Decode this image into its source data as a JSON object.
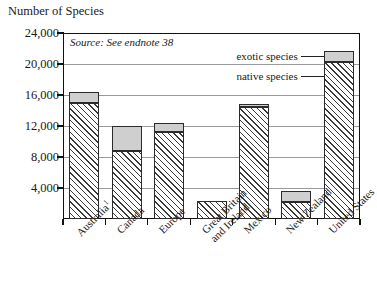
{
  "chart_data": {
    "type": "bar",
    "stacked": true,
    "title": "Number of Species",
    "xlabel": "",
    "ylabel": "Number of Species",
    "ylim": [
      0,
      24000
    ],
    "ytick_values": [
      4000,
      8000,
      12000,
      16000,
      20000,
      24000
    ],
    "ytick_labels": [
      "4,000",
      "8,000",
      "12,000",
      "16,000",
      "20,000",
      "24,000"
    ],
    "grid": true,
    "grid_axis": "y",
    "legend_position": "inside-right",
    "source_note": "Source: See endnote 38",
    "categories": [
      "Australia¹",
      "Canada",
      "Europe",
      "Great Britain and Ireland",
      "Mexico",
      "New Zealand",
      "United States"
    ],
    "category_lines": [
      [
        "Australia",
        "1"
      ],
      [
        "Canada",
        ""
      ],
      [
        "Europe",
        ""
      ],
      [
        "Great Britain",
        "and Ireland"
      ],
      [
        "Mexico",
        ""
      ],
      [
        "New Zealand",
        ""
      ],
      [
        "United States",
        ""
      ]
    ],
    "series": [
      {
        "name": "native species",
        "key": "native",
        "fill": "hatched-diagonal",
        "values": [
          15000,
          8800,
          11200,
          2300,
          14500,
          2200,
          20300
        ]
      },
      {
        "name": "exotic species",
        "key": "exotic",
        "fill": "#cfcfcf",
        "values": [
          1400,
          3200,
          1200,
          0,
          300,
          1400,
          1400
        ]
      }
    ],
    "totals": [
      16400,
      12000,
      12400,
      2300,
      14800,
      3600,
      21700
    ],
    "legend": [
      {
        "label": "exotic species",
        "key": "exotic"
      },
      {
        "label": "native species",
        "key": "native"
      }
    ]
  },
  "colors": {
    "exotic_fill": "#cfcfcf",
    "native_fill": "#ffffff",
    "hatch_stroke": "#3a3a3a",
    "bar_outline": "#2b2b2b",
    "axis": "#111111",
    "gridline": "#9a9a9a"
  }
}
